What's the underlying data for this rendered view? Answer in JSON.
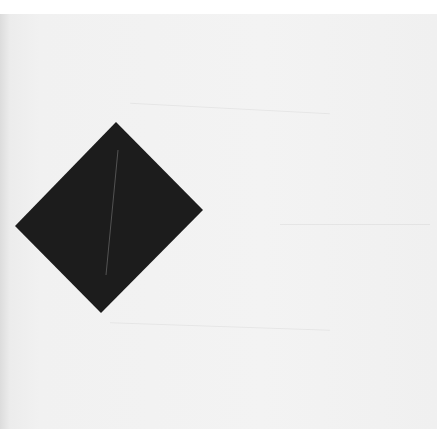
{
  "scene": {
    "description": "Photograph of a black square rotated as a diamond on off-white paper",
    "background_color": "#ffffff",
    "paper_color": "#f1f1f1",
    "shape": {
      "type": "diamond",
      "fill": "#1c1c1c",
      "vertices": [
        [
          116,
          122
        ],
        [
          203,
          210
        ],
        [
          101,
          313
        ],
        [
          15,
          226
        ]
      ],
      "crease_color": "#7a7a7a"
    }
  }
}
